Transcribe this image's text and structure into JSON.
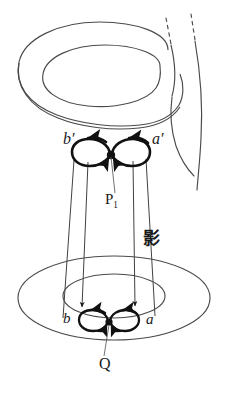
{
  "figure": {
    "background_color": "#ffffff",
    "stroke_color": "#3a3a3a",
    "heavy_stroke_color": "#111111",
    "width": 237,
    "height": 396
  },
  "labels": {
    "b_prime": "b′",
    "a_prime": "a′",
    "p_one_base": "P",
    "p_one_sub": "1",
    "shadow_cjk": "影",
    "b": "b",
    "a": "a",
    "q": "Q"
  },
  "shapes": {
    "upper_torus": "torus-outer-ellipse-and-inner-hole",
    "lower_annulus": "shadow-annulus-two-concentric-ellipses",
    "tube": "vertical-tube-right-with-dashed-top",
    "projection_cone": "four-lines-from-upper-loops-to-lower-loops",
    "upper_loops": "two-circular-arrow-loops-joined-at-node",
    "lower_loops": "two-small-circular-arrow-loops-joined-at-node",
    "upper_node": "black-dot-P1",
    "lower_node": "black-dot-Q"
  }
}
